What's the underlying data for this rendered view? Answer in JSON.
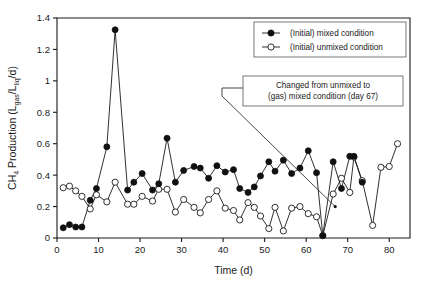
{
  "chart_data": {
    "type": "line",
    "title": "",
    "xlabel": "Time (d)",
    "ylabel": "CH4 Production (Lgas/Lliq/d)",
    "ylabel_main": "CH",
    "ylabel_sub": "4",
    "ylabel_rest": " Production (L",
    "ylabel_sub2": "gas",
    "ylabel_mid": "/L",
    "ylabel_sub3": "liq",
    "ylabel_end": "/d)",
    "xlim": [
      0,
      85
    ],
    "ylim": [
      0,
      1.4
    ],
    "xticks": [
      0,
      10,
      20,
      30,
      40,
      50,
      60,
      70,
      80
    ],
    "yticks": [
      0,
      0.2,
      0.4,
      0.6,
      0.8,
      1,
      1.2,
      1.4
    ],
    "ytick_labels": [
      "0",
      "0.2",
      "0.4",
      "0.6",
      "0.8",
      "1",
      "1.2",
      "1.4"
    ],
    "xtick_labels": [
      "0",
      "10",
      "20",
      "30",
      "40",
      "50",
      "60",
      "70",
      "80"
    ],
    "grid": false,
    "legend_position": "top-right",
    "series": [
      {
        "name": "(Initial) mixed condition",
        "marker": "filled-circle",
        "color": "#101010",
        "x": [
          1.5,
          3,
          4.5,
          6,
          8,
          9.5,
          12,
          14,
          17,
          18.5,
          20.5,
          23,
          24.5,
          26.5,
          28.5,
          30.5,
          33,
          34.5,
          36.5,
          38.5,
          40.5,
          42.5,
          44,
          46,
          47.5,
          49,
          51,
          52.5,
          54.5,
          56.5,
          58.5,
          60.5,
          62.5,
          64,
          66.5,
          68.5,
          70.5,
          71.5,
          73.5
        ],
        "values": [
          0.065,
          0.085,
          0.07,
          0.07,
          0.24,
          0.315,
          0.58,
          1.325,
          0.305,
          0.355,
          0.41,
          0.305,
          0.345,
          0.635,
          0.355,
          0.43,
          0.455,
          0.445,
          0.38,
          0.46,
          0.42,
          0.435,
          0.315,
          0.29,
          0.325,
          0.395,
          0.485,
          0.425,
          0.495,
          0.41,
          0.445,
          0.555,
          0.415,
          0.015,
          0.485,
          0.315,
          0.52,
          0.52,
          0.355
        ]
      },
      {
        "name": "(Initial) unmixed condition",
        "marker": "open-circle",
        "color": "#ffffff",
        "x": [
          1.5,
          3,
          4.5,
          6,
          8,
          9.5,
          12,
          14,
          17,
          18.5,
          20.5,
          23,
          24.5,
          26.5,
          28.5,
          30.5,
          33,
          34.5,
          36.5,
          38.5,
          40.5,
          42.5,
          44,
          46,
          47.5,
          49,
          51,
          52.5,
          54.5,
          56.5,
          58.5,
          60.5,
          62.5,
          64,
          66.5,
          68.5,
          70.5,
          71.5,
          73.5,
          76,
          78,
          80,
          82
        ],
        "values": [
          0.32,
          0.33,
          0.3,
          0.265,
          0.185,
          0.275,
          0.23,
          0.355,
          0.215,
          0.215,
          0.265,
          0.235,
          0.31,
          0.31,
          0.165,
          0.245,
          0.195,
          0.16,
          0.245,
          0.3,
          0.19,
          0.175,
          0.115,
          0.225,
          0.195,
          0.14,
          0.06,
          0.195,
          0.045,
          0.19,
          0.2,
          0.155,
          0.135,
          0.015,
          0.28,
          0.38,
          0.29,
          0.515,
          0.365,
          0.08,
          0.45,
          0.455,
          0.6
        ]
      }
    ],
    "annotation": {
      "line1": "Changed from unmixed to",
      "line2": "(gas) mixed condition (day 67)",
      "point_day": 67,
      "point_value": 0.2
    }
  },
  "legend": {
    "items": [
      {
        "label": "(Initial) mixed condition",
        "marker": "filled-circle"
      },
      {
        "label": "(Initial) unmixed condition",
        "marker": "open-circle"
      }
    ]
  }
}
